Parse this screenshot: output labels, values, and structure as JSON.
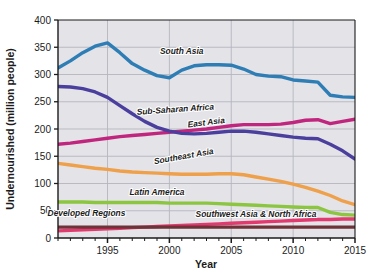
{
  "chart_data": {
    "type": "line",
    "title": "",
    "xlabel": "Year",
    "ylabel": "Undernourished (million people)",
    "xlim": [
      1991,
      2015
    ],
    "ylim": [
      0,
      400
    ],
    "ytick_step": 50,
    "yticks": [
      0,
      50,
      100,
      150,
      200,
      250,
      300,
      350,
      400
    ],
    "xticks": [
      1995,
      2000,
      2005,
      2010,
      2015
    ],
    "xtick_minor_step": 1,
    "grid": "horizontal",
    "legend": "inline-labels",
    "x": [
      1991,
      1992,
      1993,
      1994,
      1995,
      1996,
      1997,
      1998,
      1999,
      2000,
      2001,
      2002,
      2003,
      2004,
      2005,
      2006,
      2007,
      2008,
      2009,
      2010,
      2011,
      2012,
      2013,
      2014,
      2015
    ],
    "series": [
      {
        "name": "South Asia",
        "color": "#2E7DB5",
        "label_x": 2001.0,
        "label_y": 337,
        "label_rotate": 0,
        "values": [
          312,
          325,
          340,
          352,
          358,
          340,
          320,
          308,
          298,
          294,
          308,
          316,
          318,
          318,
          317,
          310,
          300,
          297,
          296,
          290,
          288,
          286,
          262,
          259,
          258
        ]
      },
      {
        "name": "Sub-Saharan Africa",
        "color": "#C0267E",
        "label_x": 2000.5,
        "label_y": 231,
        "label_rotate": -4,
        "values": [
          172,
          174,
          177,
          180,
          183,
          186,
          188,
          190,
          192,
          194,
          196,
          198,
          200,
          203,
          206,
          208,
          208,
          208,
          209,
          212,
          216,
          217,
          210,
          214,
          218
        ]
      },
      {
        "name": "East Asia",
        "color": "#4B3F9E",
        "label_x": 2003.0,
        "label_y": 207,
        "label_rotate": -7,
        "values": [
          278,
          277,
          274,
          268,
          258,
          243,
          228,
          214,
          203,
          196,
          192,
          191,
          192,
          194,
          196,
          196,
          194,
          191,
          188,
          185,
          183,
          182,
          172,
          160,
          145
        ]
      },
      {
        "name": "Southeast Asia",
        "color": "#EFA04A",
        "label_x": 2001.2,
        "label_y": 145,
        "label_rotate": -10,
        "values": [
          137,
          134,
          131,
          128,
          126,
          123,
          121,
          120,
          119,
          118,
          117,
          117,
          117,
          118,
          118,
          116,
          112,
          108,
          104,
          99,
          93,
          86,
          78,
          68,
          61
        ]
      },
      {
        "name": "Latin America",
        "color": "#8CC540",
        "label_x": 1999.0,
        "label_y": 78,
        "label_rotate": 0,
        "values": [
          66,
          66,
          66,
          65,
          65,
          65,
          65,
          65,
          65,
          64,
          64,
          64,
          64,
          63,
          62,
          61,
          60,
          59,
          58,
          57,
          56,
          56,
          47,
          43,
          42
        ]
      },
      {
        "name": "Southwest Asia & North Africa",
        "color": "#E23A6E",
        "label_x": 2007.0,
        "label_y": 39,
        "label_rotate": 0,
        "values": [
          13,
          14,
          15,
          16,
          17,
          18,
          19,
          20,
          21,
          22,
          23,
          24,
          25,
          26,
          27,
          28,
          29,
          30,
          31,
          32,
          33,
          34,
          34,
          35,
          35
        ]
      },
      {
        "name": "Developed Regions",
        "color": "#6E3338",
        "label_x": 1993.3,
        "label_y": 40,
        "label_rotate": 0,
        "values": [
          20,
          20,
          20,
          20,
          20,
          20,
          20,
          20,
          20,
          20,
          20,
          20,
          20,
          20,
          20,
          20,
          20,
          20,
          20,
          20,
          20,
          20,
          20,
          20,
          20
        ]
      }
    ]
  },
  "axes": {
    "y_title": "Undernourished (million people)",
    "x_title": "Year",
    "y_tick_labels": [
      "400",
      "350",
      "300",
      "250",
      "200",
      "150",
      "100",
      "50",
      "0"
    ],
    "x_tick_labels": [
      "1995",
      "2000",
      "2005",
      "2010",
      "2015"
    ]
  },
  "colors": {
    "plot_background": "#E3E3E8",
    "grid": "#B6B6BE",
    "axis": "#1b1b1b",
    "page_background": "#ffffff"
  }
}
